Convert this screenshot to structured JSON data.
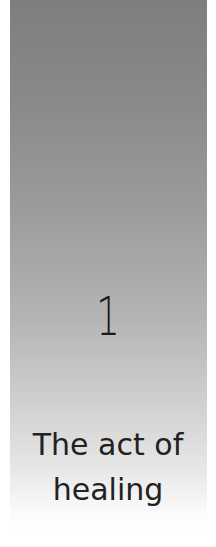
{
  "chapter": {
    "number": "1",
    "title_line1": "The act of",
    "title_line2": "healing"
  },
  "colors": {
    "gradient_top": "#7e7e7e",
    "gradient_bottom": "#ffffff",
    "text": "#222222"
  }
}
